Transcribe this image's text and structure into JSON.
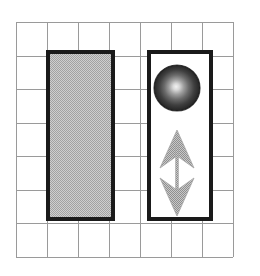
{
  "figure": {
    "canvas": {
      "width": 260,
      "height": 276,
      "background_color": "#ffffff"
    },
    "grid": {
      "name": "background-grid",
      "line_color": "#9a9a9a",
      "line_width": 1,
      "x_start": 16,
      "y_start": 22,
      "cell_width": 31,
      "cell_height": 33.5,
      "columns": 7,
      "rows": 7
    },
    "shapes": [
      {
        "id": "left-block",
        "label": "Left shaded block",
        "type": "rectangle",
        "x": 46,
        "y": 50,
        "width": 69,
        "height": 171,
        "fill_color": "#b9b9b9",
        "stroke_color": "#1a1a1a",
        "stroke_width": 4
      },
      {
        "id": "right-block",
        "label": "Right open block",
        "type": "rectangle",
        "x": 147,
        "y": 50,
        "width": 66,
        "height": 171,
        "fill_color": "#ffffff",
        "stroke_color": "#1a1a1a",
        "stroke_width": 4
      },
      {
        "id": "sphere",
        "label": "Shaded sphere",
        "type": "circle",
        "cx": 177,
        "cy": 88,
        "r": 23,
        "fill_center_color": "#e8e8e8",
        "fill_mid_color": "#6e6e6e",
        "fill_edge_color": "#1c1c1c",
        "highlight_x": 176,
        "highlight_y": 88
      },
      {
        "id": "double-arrow",
        "label": "Vertical double-headed arrow",
        "type": "double-arrow",
        "x": 177,
        "y_top": 130,
        "y_bottom": 216,
        "shaft_width": 3,
        "head_half_width": 17,
        "head_length": 38,
        "barb_inset": 11,
        "fill_color": "#b0b0b0",
        "stroke_color": "#9a9a9a"
      }
    ]
  }
}
